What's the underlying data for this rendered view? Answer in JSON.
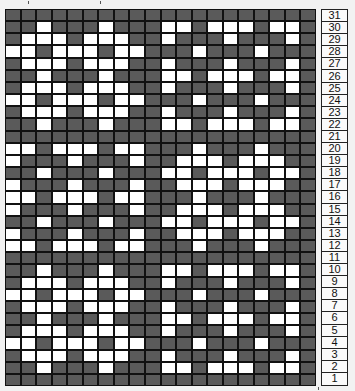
{
  "chart": {
    "title": "",
    "columns": 20,
    "rows": 31,
    "row_labels_top_to_bottom": [
      "31",
      "30",
      "29",
      "28",
      "27",
      "26",
      "25",
      "24",
      "23",
      "22",
      "21",
      "20",
      "19",
      "18",
      "17",
      "16",
      "15",
      "14",
      "13",
      "12",
      "11",
      "10",
      "9",
      "8",
      "7",
      "6",
      "5",
      "4",
      "3",
      "2",
      "1"
    ],
    "legend": {
      "dark": "#5a5a5a",
      "light": "#ffffff",
      "border": "#111111"
    },
    "pattern_top_to_bottom": [
      "DDDDDDDDDDDDDDDDDDDD",
      "DDWDDDWDDDWWDWWWDWWD",
      "DWWWDWWWDDWDDDWDDDWD",
      "WWDWWWDWWDDDWDDDWDDD",
      "DWWWDWWWDDWDDDWDDDWD",
      "DDWDDDWDDDWWDWWWDWWD",
      "DWWWDWWWDDWDDDWDDDWD",
      "WWDWWWDWWDDDWDDDWDDD",
      "DWWWDWWWDDWDDDWDDDWD",
      "DDWDDDWDDDWWDWWWDWWD",
      "DDDDDDDDDDDDDDDDDDDD",
      "WWDWWWDWWDDDWDDDWDDD",
      "WDDDWDDDWDDWWWDWWWDD",
      "DDWDDDWDDDWWDWWWDWWD",
      "WDDDWDDDWDDWWWDWWWDD",
      "WWDWWWDWWDDDWDDDWDDD",
      "WDDDWDDDWDDWWWDWWWDD",
      "DDWDDDWDDDWWDWWWDWWD",
      "WDDDWDDDWDDWWWDWWWDD",
      "WWDWWWDWWDDDWDDDWDDD",
      "DDDDDDDDDDDDDDDDDDDD",
      "DDWDDDWDDDWWDWWWDWWD",
      "DWWWDWWWDDWDDDWDDDWD",
      "WWDWWWDWWDDDWDDDWDDD",
      "DWWWDWWWDDWDDDWDDDWD",
      "DDWDDDWDDDWWDWWWDWWD",
      "DWWWDWWWDDWDDDWDDDWD",
      "WWDWWWDWWDDDWDDDWDDD",
      "DWWWDWWWDDWDDDWDDDWD",
      "DDWDDDWDDDWWDWWWDWWD",
      "DDDDDDDDDDDDDDDDDDDD"
    ]
  }
}
